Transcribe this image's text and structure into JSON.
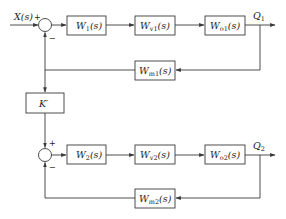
{
  "diagram": {
    "type": "block-diagram",
    "input": {
      "label": "X(s)",
      "sign": "+"
    },
    "loop1": {
      "summer_signs": {
        "input": "+",
        "feedback": "−"
      },
      "forward_blocks": [
        {
          "name": "W",
          "sub": "1",
          "arg": "(s)"
        },
        {
          "name": "W",
          "sub": "v1",
          "arg": "(s)"
        },
        {
          "name": "W",
          "sub": "o1",
          "arg": "(s)"
        }
      ],
      "feedback_block": {
        "name": "W",
        "sub": "m1",
        "arg": "(s)"
      },
      "output": {
        "name": "Q",
        "sub": "1"
      }
    },
    "coupling_block": {
      "label": "K′"
    },
    "loop2": {
      "summer_signs": {
        "input": "+",
        "feedback": "−"
      },
      "forward_blocks": [
        {
          "name": "W",
          "sub": "2",
          "arg": "(s)"
        },
        {
          "name": "W",
          "sub": "v2",
          "arg": "(s)"
        },
        {
          "name": "W",
          "sub": "o2",
          "arg": "(s)"
        }
      ],
      "feedback_block": {
        "name": "W",
        "sub": "m2",
        "arg": "(s)"
      },
      "output": {
        "name": "Q",
        "sub": "2"
      }
    },
    "colors": {
      "line": "#3a3a3a",
      "background": "#ffffff",
      "text": "#222222"
    }
  }
}
